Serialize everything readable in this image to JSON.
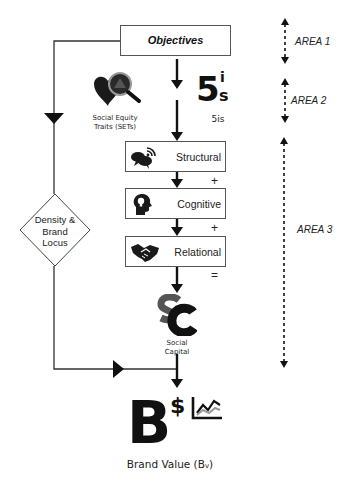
{
  "diagram": {
    "top_box": {
      "label": "Objectives"
    },
    "sets": {
      "icon": "heart-magnifier-icon",
      "caption_line1": "Social Equity",
      "caption_line2": "Traits (SETs)"
    },
    "five_is": {
      "big": "5",
      "sup": "i",
      "sub": "s",
      "caption": "5is"
    },
    "steps": [
      {
        "label": "Structural",
        "icon": "chat-bubbles-wifi-icon",
        "operator": "+"
      },
      {
        "label": "Cognitive",
        "icon": "head-lightbulb-icon",
        "operator": "+"
      },
      {
        "label": "Relational",
        "icon": "handshake-icon",
        "operator": "="
      }
    ],
    "social_capital": {
      "logo": "SC",
      "caption_line1": "Social",
      "caption_line2": "Capital"
    },
    "decision": {
      "line1": "Density &",
      "line2": "Brand",
      "line3": "Locus"
    },
    "brand_value": {
      "big": "B",
      "dollar": "$",
      "chart_icon": "line-chart-icon",
      "label": "Brand Value (B",
      "label_sub": "v",
      "label_end": ")"
    },
    "areas": [
      {
        "label": "AREA 1"
      },
      {
        "label": "AREA 2"
      },
      {
        "label": "AREA 3"
      }
    ]
  }
}
